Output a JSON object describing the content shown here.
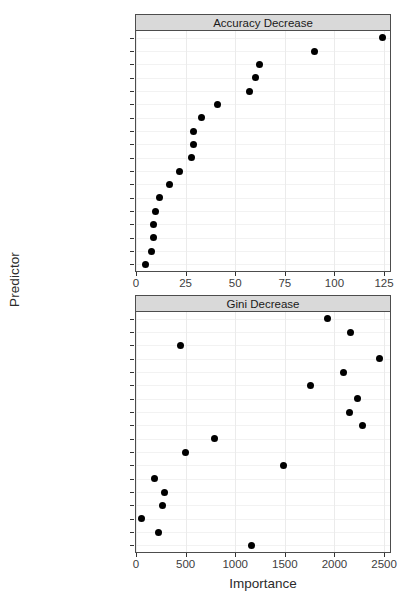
{
  "figure": {
    "ylabel": "Predictor",
    "xlabel": "Importance"
  },
  "chart_data": [
    {
      "type": "scatter",
      "title": "Accuracy Decrease",
      "panel": "top",
      "xlabel": "",
      "ylabel": "Predictor",
      "xlim": [
        0,
        128
      ],
      "xticks": [
        0,
        25,
        50,
        75,
        100,
        125
      ],
      "xticklabels": [
        "0",
        "25",
        "50",
        "75",
        "100",
        "125"
      ],
      "grid": true,
      "legend": "none",
      "categories": [
        "borrower_score",
        "grade",
        "term",
        "payment_inc_ratio",
        "annual_inc",
        "loan_amnt",
        "revol_util",
        "revol_bal",
        "dti",
        "purpose",
        "purpose_",
        "open_acc",
        "pub_rec_zero",
        "home_ownership",
        "home_",
        "emp_len_",
        "delinq_2yrs_zero",
        "emp_length"
      ],
      "values": [
        124,
        90,
        62,
        60,
        57,
        41,
        33,
        29,
        29,
        28,
        22,
        17,
        12,
        10,
        9,
        9,
        8,
        5
      ]
    },
    {
      "type": "scatter",
      "title": "Gini Decrease",
      "panel": "bottom",
      "xlabel": "Importance",
      "ylabel": "Predictor",
      "xlim": [
        0,
        2560
      ],
      "xticks": [
        0,
        500,
        1000,
        1500,
        2000,
        2500
      ],
      "xticklabels": [
        "0",
        "500",
        "1000",
        "1500",
        "2000",
        "2500"
      ],
      "grid": true,
      "legend": "none",
      "categories": [
        "borrower_score",
        "grade",
        "term",
        "payment_inc_ratio",
        "annual_inc",
        "loan_amnt",
        "revol_util",
        "revol_bal",
        "dti",
        "purpose",
        "purpose_",
        "open_acc",
        "pub_rec_zero",
        "home_ownership",
        "home_",
        "emp_len_",
        "delinq_2yrs_zero",
        "emp_length"
      ],
      "values": [
        1930,
        2160,
        450,
        2450,
        2090,
        1760,
        2230,
        2150,
        2280,
        790,
        500,
        1490,
        185,
        290,
        265,
        60,
        225,
        1165
      ]
    }
  ]
}
